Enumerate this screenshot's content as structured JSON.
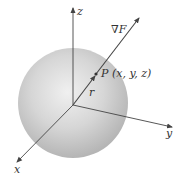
{
  "diagram": {
    "type": "3d-sphere-gradient",
    "axes": {
      "x": {
        "label": "x"
      },
      "y": {
        "label": "y"
      },
      "z": {
        "label": "z"
      }
    },
    "gradient_label_symbol": "∇",
    "gradient_label_var": "F",
    "point_label": "P (x, y, z)",
    "radius_label": "r",
    "colors": {
      "sphere_light": "#ededed",
      "sphere_mid": "#cfcfcf",
      "sphere_dark": "#b3b3b3",
      "axis": "#444444",
      "text": "#333333",
      "background": "#ffffff"
    }
  }
}
